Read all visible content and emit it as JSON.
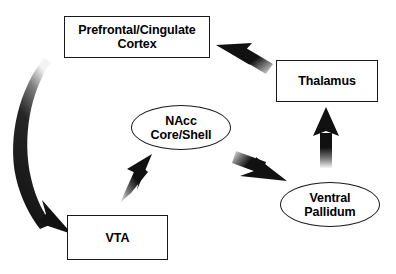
{
  "diagram": {
    "canvas": {
      "width": 396,
      "height": 274,
      "background": "#ffffff"
    },
    "ink_color": "#1a1a1a",
    "nodes": [
      {
        "id": "cortex",
        "label": "Prefrontal/Cingulate\nCortex",
        "shape": "rectangle",
        "x": 64,
        "y": 16,
        "width": 146,
        "height": 42
      },
      {
        "id": "thalamus",
        "label": "Thalamus",
        "shape": "rectangle",
        "x": 276,
        "y": 60,
        "width": 102,
        "height": 42
      },
      {
        "id": "nacc",
        "label": "NAcc\nCore/Shell",
        "shape": "ellipse",
        "x": 131,
        "y": 105,
        "width": 100,
        "height": 45
      },
      {
        "id": "ventral_pallidum",
        "label": "Ventral\nPallidum",
        "shape": "ellipse",
        "x": 280,
        "y": 182,
        "width": 100,
        "height": 45
      },
      {
        "id": "vta",
        "label": "VTA",
        "shape": "rectangle",
        "x": 67,
        "y": 215,
        "width": 101,
        "height": 45
      }
    ],
    "arrows": [
      {
        "id": "cortex-to-vta",
        "from": "cortex",
        "to": "vta",
        "style": "curved-thick",
        "direction": "down-left-curve"
      },
      {
        "id": "vta-to-nacc",
        "from": "vta",
        "to": "nacc",
        "style": "straight",
        "direction": "up-right"
      },
      {
        "id": "nacc-to-vp",
        "from": "nacc",
        "to": "ventral_pallidum",
        "style": "straight",
        "direction": "down-right"
      },
      {
        "id": "vp-to-thalamus",
        "from": "ventral_pallidum",
        "to": "thalamus",
        "style": "straight",
        "direction": "up"
      },
      {
        "id": "thalamus-to-cortex",
        "from": "thalamus",
        "to": "cortex",
        "style": "straight",
        "direction": "up-left"
      }
    ]
  }
}
